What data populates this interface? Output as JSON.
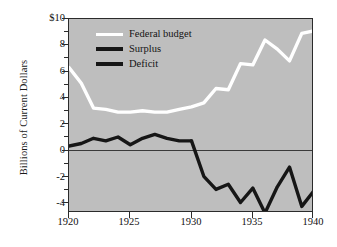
{
  "chart_data": {
    "type": "line",
    "title": "",
    "xlabel": "",
    "ylabel": "Billions of Current Dollars",
    "xlim": [
      1920,
      1940
    ],
    "ylim": [
      -4.8,
      10
    ],
    "xticks": [
      1920,
      1925,
      1930,
      1935,
      1940
    ],
    "xticklabels": [
      "1920",
      "1925",
      "1930",
      "1935",
      "1940"
    ],
    "yticks": [
      10,
      8,
      6,
      4,
      2,
      0,
      -2,
      -4
    ],
    "yticklabels": [
      "$10",
      "8",
      "6",
      "4",
      "2",
      "0",
      "-2",
      "-4"
    ],
    "grid": false,
    "zero_line": 0,
    "legend_position": "top-left",
    "background_color": "#bebebe",
    "x": [
      1920,
      1921,
      1922,
      1923,
      1924,
      1925,
      1926,
      1927,
      1928,
      1929,
      1930,
      1931,
      1932,
      1933,
      1934,
      1935,
      1936,
      1937,
      1938,
      1939,
      1940
    ],
    "series": [
      {
        "name": "Federal budget",
        "color": "#ffffff",
        "values": [
          6.3,
          5.1,
          3.2,
          3.1,
          2.9,
          2.9,
          3.0,
          2.9,
          2.9,
          3.1,
          3.3,
          3.6,
          4.7,
          4.6,
          6.6,
          6.5,
          8.4,
          7.7,
          6.8,
          8.9,
          9.1
        ]
      },
      {
        "name": "Surplus",
        "color": "#161616",
        "values": [
          0.3,
          0.5,
          0.9,
          0.7,
          1.0,
          0.4,
          0.9,
          1.2,
          0.9,
          0.7,
          0.7,
          null,
          null,
          null,
          null,
          null,
          null,
          null,
          null,
          null,
          null
        ]
      },
      {
        "name": "Deficit",
        "color": "#161616",
        "values": [
          null,
          null,
          null,
          null,
          null,
          null,
          null,
          null,
          null,
          null,
          0.7,
          -2.0,
          -3.0,
          -2.6,
          -4.0,
          -2.9,
          -4.8,
          -2.8,
          -1.3,
          -4.3,
          -3.1
        ]
      }
    ]
  },
  "legend": {
    "entries": [
      {
        "label": "Federal budget",
        "color": "#ffffff"
      },
      {
        "label": "Surplus",
        "color": "#161616"
      },
      {
        "label": "Deficit",
        "color": "#161616"
      }
    ]
  },
  "axes": {
    "y_title": "Billions of Current Dollars",
    "y_labels": [
      "$10",
      "8",
      "6",
      "4",
      "2",
      "0",
      "-2",
      "-4"
    ],
    "x_labels": [
      "1920",
      "1925",
      "1930",
      "1935",
      "1940"
    ]
  }
}
